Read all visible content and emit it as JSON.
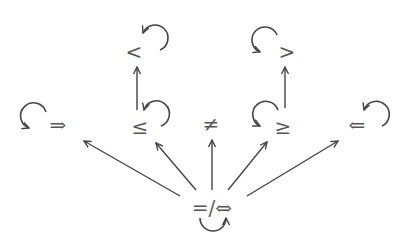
{
  "diagram": {
    "type": "relation-lattice",
    "colors": {
      "stroke": "#444444",
      "text": "#555555",
      "background": "#ffffff"
    },
    "nodes": [
      {
        "id": "lt",
        "label": "<",
        "self_loop": true
      },
      {
        "id": "gt",
        "label": ">",
        "self_loop": true
      },
      {
        "id": "implies",
        "label": "⇒",
        "self_loop": true
      },
      {
        "id": "le",
        "label": "≤",
        "self_loop": true
      },
      {
        "id": "ne",
        "label": "≠",
        "self_loop": false
      },
      {
        "id": "ge",
        "label": "≥",
        "self_loop": true
      },
      {
        "id": "impliedby",
        "label": "⇐",
        "self_loop": true
      },
      {
        "id": "root",
        "label": "=/⇔",
        "self_loop": true
      }
    ],
    "edges": [
      {
        "from": "le",
        "to": "lt"
      },
      {
        "from": "ge",
        "to": "gt"
      },
      {
        "from": "root",
        "to": "implies"
      },
      {
        "from": "root",
        "to": "le"
      },
      {
        "from": "root",
        "to": "ne"
      },
      {
        "from": "root",
        "to": "ge"
      },
      {
        "from": "root",
        "to": "impliedby"
      }
    ]
  }
}
